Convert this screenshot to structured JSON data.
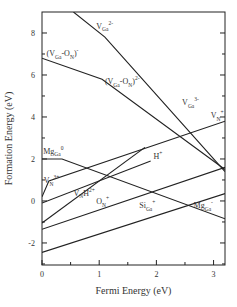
{
  "chart_data": {
    "type": "line",
    "title": "",
    "xlabel": "Fermi Energy (eV)",
    "ylabel": "Formation Energy (eV)",
    "xlim": [
      0,
      3.2
    ],
    "ylim": [
      -3.05,
      9.0
    ],
    "xticks": [
      0,
      1,
      2,
      3
    ],
    "xminor": [
      0.5,
      1.5,
      2.5
    ],
    "yticks": [
      -2,
      0,
      2,
      4,
      6,
      8
    ],
    "yminor": [
      -3,
      -1,
      1,
      3,
      5,
      7
    ],
    "grid": false,
    "legend": "none",
    "series": [
      {
        "name": "V_Ga",
        "points": [
          [
            0.55,
            9.0
          ],
          [
            1.1,
            7.8
          ],
          [
            3.2,
            1.4
          ]
        ]
      },
      {
        "name": "V_Ga-O_N",
        "points": [
          [
            0.0,
            6.8
          ],
          [
            1.05,
            5.8
          ],
          [
            3.2,
            1.5
          ]
        ]
      },
      {
        "name": "V_N",
        "points": [
          [
            0.0,
            0.2
          ],
          [
            0.12,
            0.95
          ],
          [
            3.2,
            3.8
          ]
        ]
      },
      {
        "name": "Mg_Ga",
        "points": [
          [
            0.0,
            2.0
          ],
          [
            0.35,
            2.0
          ],
          [
            3.2,
            -0.85
          ]
        ]
      },
      {
        "name": "V_N H",
        "points": [
          [
            0.0,
            -1.05
          ],
          [
            1.8,
            2.55
          ]
        ]
      },
      {
        "name": "H",
        "points": [
          [
            0.0,
            -0.1
          ],
          [
            1.9,
            1.9
          ]
        ]
      },
      {
        "name": "O_N",
        "points": [
          [
            0.0,
            -1.35
          ],
          [
            3.2,
            1.6
          ]
        ]
      },
      {
        "name": "Si_Ga",
        "points": [
          [
            0.0,
            -2.45
          ],
          [
            3.2,
            0.35
          ]
        ]
      }
    ],
    "annotations": [
      {
        "base": "V",
        "sub": "Ga",
        "sup": "2-",
        "at": [
          0.95,
          8.2
        ]
      },
      {
        "base": "(V",
        "sub": "Ga",
        "mid": "-O",
        "sub2": "N",
        "tail": ")",
        "sup": "-",
        "at": [
          0.08,
          6.9
        ]
      },
      {
        "base": "(V",
        "sub": "Ga",
        "mid": "-O",
        "sub2": "N",
        "tail": ")",
        "sup": "2-",
        "at": [
          1.1,
          5.55
        ]
      },
      {
        "base": "V",
        "sub": "Ga",
        "sup": "3-",
        "at": [
          2.45,
          4.55
        ]
      },
      {
        "base": "V",
        "sub": "N",
        "sup": "+",
        "at": [
          2.95,
          3.95
        ]
      },
      {
        "base": "Mg",
        "sub": "Ga",
        "sup": "0",
        "at": [
          0.02,
          2.25
        ]
      },
      {
        "base": "V",
        "sub": "N",
        "sup": "3+",
        "at": [
          0.03,
          0.85
        ]
      },
      {
        "base": "H",
        "sub": "",
        "sup": "+",
        "at": [
          1.95,
          2.0
        ]
      },
      {
        "base": "V",
        "sub": "N",
        "mid": "H",
        "sup": "2+",
        "at": [
          0.55,
          0.25
        ]
      },
      {
        "base": "O",
        "sub": "N",
        "sup": "+",
        "at": [
          0.95,
          -0.15
        ]
      },
      {
        "base": "Si",
        "sub": "Ga",
        "sup": "+",
        "at": [
          1.7,
          -0.35
        ]
      },
      {
        "base": "Mg",
        "sub": "Ga",
        "sup": "-",
        "at": [
          2.65,
          -0.35
        ]
      }
    ]
  }
}
